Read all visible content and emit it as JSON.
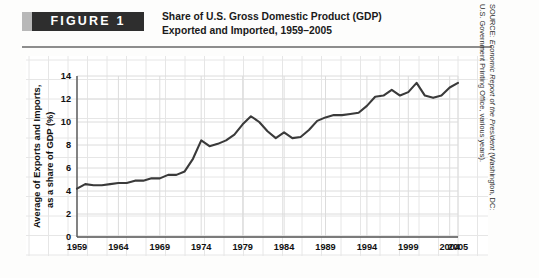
{
  "figure": {
    "badge_label": "FIGURE  1",
    "title_line1": "Share of U.S. Gross Domestic Product (GDP)",
    "title_line2": "Exported and Imported, 1959–2005"
  },
  "source": {
    "prefix": "SOURCE: ",
    "italic": "Economic Report of the President",
    "suffix": " (Washington, DC:",
    "line2": "U.S. Government Printing Office, various years)."
  },
  "chart_data": {
    "type": "line",
    "title": "Share of U.S. Gross Domestic Product (GDP) Exported and Imported, 1959–2005",
    "xlabel": "",
    "ylabel": "Average of Exports and Imports, as a share of GDP (%)",
    "ylabel_line1": "Average of Exports and Imports,",
    "ylabel_line2": "as a share of GDP (%)",
    "xlim": [
      1959,
      2005
    ],
    "ylim": [
      0,
      14
    ],
    "yticks": [
      0,
      2,
      4,
      6,
      8,
      10,
      12,
      14
    ],
    "xticks": [
      1959,
      1964,
      1969,
      1974,
      1979,
      1984,
      1989,
      1994,
      1999,
      2004,
      2005
    ],
    "grid": true,
    "legend": "none",
    "line_color": "#3a3a3a",
    "series": [
      {
        "name": "Average of exports and imports as share of GDP",
        "x": [
          1959,
          1960,
          1961,
          1962,
          1963,
          1964,
          1965,
          1966,
          1967,
          1968,
          1969,
          1970,
          1971,
          1972,
          1973,
          1974,
          1975,
          1976,
          1977,
          1978,
          1979,
          1980,
          1981,
          1982,
          1983,
          1984,
          1985,
          1986,
          1987,
          1988,
          1989,
          1990,
          1991,
          1992,
          1993,
          1994,
          1995,
          1996,
          1997,
          1998,
          1999,
          2000,
          2001,
          2002,
          2003,
          2004,
          2005
        ],
        "values": [
          4.2,
          4.6,
          4.5,
          4.5,
          4.6,
          4.7,
          4.7,
          4.9,
          4.9,
          5.1,
          5.1,
          5.4,
          5.4,
          5.7,
          6.8,
          8.4,
          7.9,
          8.1,
          8.4,
          8.9,
          9.8,
          10.5,
          10.0,
          9.2,
          8.6,
          9.1,
          8.6,
          8.7,
          9.3,
          10.1,
          10.4,
          10.6,
          10.6,
          10.7,
          10.8,
          11.4,
          12.2,
          12.3,
          12.8,
          12.3,
          12.6,
          13.4,
          12.3,
          12.1,
          12.3,
          13.0,
          13.4
        ]
      }
    ]
  }
}
